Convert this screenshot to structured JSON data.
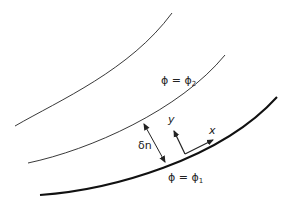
{
  "diagram": {
    "curves": [
      {
        "name": "streamline-upper",
        "label": ""
      },
      {
        "name": "streamline-phi2",
        "label": "φ = φ2"
      },
      {
        "name": "streamline-phi1",
        "label": "φ = φ1"
      }
    ],
    "labels": {
      "phi2_lhs": "ϕ = ϕ",
      "phi2_sub": "2",
      "phi1_lhs": "ϕ = ϕ",
      "phi1_sub": "1",
      "delta_n": "δn",
      "axis_x": "x",
      "axis_y": "y"
    },
    "colors": {
      "line": "#222222",
      "background": "#ffffff"
    }
  }
}
